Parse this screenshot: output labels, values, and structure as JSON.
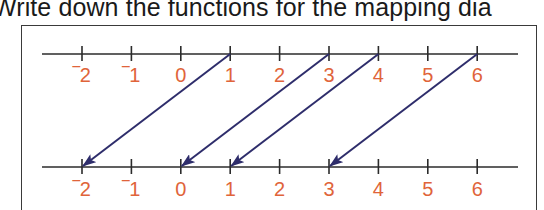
{
  "heading": "Write down the functions for the mapping dia",
  "colors": {
    "label": "#e0643a",
    "axis": "#2b2b2b",
    "arrow": "#2e2d6b",
    "frame": "#3a3a3a",
    "text": "#1a1a1a"
  },
  "number_lines": {
    "top": {
      "ticks": [
        "‾2",
        "‾1",
        "0",
        "1",
        "2",
        "3",
        "4",
        "5",
        "6"
      ]
    },
    "bottom": {
      "ticks": [
        "‾2",
        "‾1",
        "0",
        "1",
        "2",
        "3",
        "4",
        "5",
        "6"
      ]
    }
  },
  "mappings": [
    {
      "from": 1,
      "to": -2
    },
    {
      "from": 3,
      "to": 0
    },
    {
      "from": 4,
      "to": 1
    },
    {
      "from": 6,
      "to": 3
    }
  ]
}
